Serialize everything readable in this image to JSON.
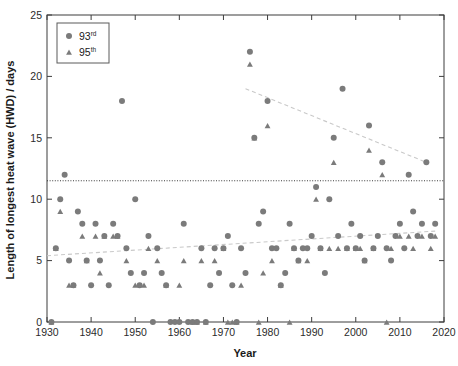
{
  "chart_data": {
    "type": "scatter",
    "title": "",
    "xlabel": "Year",
    "ylabel": "Length of longest heat wave (HWD) / days",
    "xlim": [
      1930,
      2020
    ],
    "ylim": [
      0,
      25
    ],
    "xticks": [
      1930,
      1940,
      1950,
      1960,
      1970,
      1980,
      1990,
      2000,
      2010,
      2020
    ],
    "yticks": [
      0,
      5,
      10,
      15,
      20,
      25
    ],
    "grid": false,
    "legend_position": "top-left",
    "legend": [
      {
        "label": "93",
        "suffix": "rd",
        "marker": "circle",
        "color": "#7b7b7b"
      },
      {
        "label": "95",
        "suffix": "th",
        "marker": "triangle",
        "color": "#7b7b7b"
      }
    ],
    "annotations": [
      {
        "name": "reference-line",
        "type": "horizontal-dotted",
        "y": 11.5,
        "color": "#3a3a3a"
      },
      {
        "name": "upper-trend-line",
        "type": "dashed-trend",
        "x0": 1975,
        "y0": 19.0,
        "x1": 2016,
        "y1": 13.0,
        "color": "#c9c9c9"
      },
      {
        "name": "lower-trend-line",
        "type": "dashed-trend",
        "x0": 1930,
        "y0": 5.4,
        "x1": 2018,
        "y1": 7.4,
        "color": "#c9c9c9"
      }
    ],
    "series": [
      {
        "name": "93rd",
        "marker": "circle",
        "color": "#7b7b7b",
        "points": [
          [
            1931,
            0
          ],
          [
            1932,
            6
          ],
          [
            1933,
            10
          ],
          [
            1934,
            12
          ],
          [
            1935,
            5
          ],
          [
            1936,
            3
          ],
          [
            1937,
            9
          ],
          [
            1938,
            8
          ],
          [
            1939,
            5
          ],
          [
            1940,
            3
          ],
          [
            1941,
            8
          ],
          [
            1942,
            5
          ],
          [
            1943,
            7
          ],
          [
            1944,
            3
          ],
          [
            1945,
            8
          ],
          [
            1946,
            7
          ],
          [
            1947,
            18
          ],
          [
            1948,
            6
          ],
          [
            1949,
            4
          ],
          [
            1950,
            10
          ],
          [
            1951,
            3
          ],
          [
            1952,
            4
          ],
          [
            1953,
            7
          ],
          [
            1954,
            0
          ],
          [
            1955,
            6
          ],
          [
            1956,
            4
          ],
          [
            1957,
            3
          ],
          [
            1958,
            0
          ],
          [
            1959,
            0
          ],
          [
            1960,
            0
          ],
          [
            1961,
            8
          ],
          [
            1962,
            0
          ],
          [
            1963,
            0
          ],
          [
            1964,
            0
          ],
          [
            1965,
            6
          ],
          [
            1966,
            0
          ],
          [
            1967,
            3
          ],
          [
            1968,
            6
          ],
          [
            1969,
            4
          ],
          [
            1970,
            6
          ],
          [
            1971,
            7
          ],
          [
            1972,
            3
          ],
          [
            1973,
            0
          ],
          [
            1974,
            6
          ],
          [
            1975,
            4
          ],
          [
            1976,
            22
          ],
          [
            1977,
            15
          ],
          [
            1978,
            8
          ],
          [
            1979,
            9
          ],
          [
            1980,
            18
          ],
          [
            1981,
            6
          ],
          [
            1982,
            6
          ],
          [
            1983,
            3
          ],
          [
            1984,
            4
          ],
          [
            1985,
            8
          ],
          [
            1986,
            6
          ],
          [
            1987,
            5
          ],
          [
            1988,
            6
          ],
          [
            1989,
            6
          ],
          [
            1990,
            7
          ],
          [
            1991,
            11
          ],
          [
            1992,
            6
          ],
          [
            1993,
            4
          ],
          [
            1994,
            10
          ],
          [
            1995,
            15
          ],
          [
            1996,
            7
          ],
          [
            1997,
            19
          ],
          [
            1998,
            6
          ],
          [
            1999,
            8
          ],
          [
            2000,
            6
          ],
          [
            2001,
            7
          ],
          [
            2002,
            5
          ],
          [
            2003,
            16
          ],
          [
            2004,
            6
          ],
          [
            2005,
            7
          ],
          [
            2006,
            13
          ],
          [
            2007,
            6
          ],
          [
            2008,
            5
          ],
          [
            2009,
            7
          ],
          [
            2010,
            8
          ],
          [
            2011,
            6
          ],
          [
            2012,
            12
          ],
          [
            2013,
            9
          ],
          [
            2014,
            7
          ],
          [
            2015,
            8
          ],
          [
            2016,
            13
          ],
          [
            2017,
            7
          ],
          [
            2018,
            8
          ]
        ]
      },
      {
        "name": "95th",
        "marker": "triangle",
        "color": "#7b7b7b",
        "points": [
          [
            1931,
            0
          ],
          [
            1932,
            6
          ],
          [
            1933,
            9
          ],
          [
            1935,
            3
          ],
          [
            1936,
            3
          ],
          [
            1938,
            7
          ],
          [
            1939,
            5
          ],
          [
            1941,
            7
          ],
          [
            1942,
            4
          ],
          [
            1943,
            7
          ],
          [
            1945,
            7
          ],
          [
            1946,
            7
          ],
          [
            1948,
            5
          ],
          [
            1950,
            3
          ],
          [
            1952,
            3
          ],
          [
            1953,
            6
          ],
          [
            1955,
            5
          ],
          [
            1957,
            3
          ],
          [
            1960,
            3
          ],
          [
            1961,
            5
          ],
          [
            1963,
            0
          ],
          [
            1964,
            0
          ],
          [
            1965,
            5
          ],
          [
            1966,
            0
          ],
          [
            1968,
            5
          ],
          [
            1970,
            6
          ],
          [
            1971,
            0
          ],
          [
            1972,
            0
          ],
          [
            1973,
            0
          ],
          [
            1974,
            3
          ],
          [
            1976,
            21
          ],
          [
            1977,
            15
          ],
          [
            1978,
            0
          ],
          [
            1979,
            4
          ],
          [
            1980,
            16
          ],
          [
            1981,
            5
          ],
          [
            1983,
            3
          ],
          [
            1985,
            0
          ],
          [
            1986,
            6
          ],
          [
            1987,
            5
          ],
          [
            1989,
            5
          ],
          [
            1991,
            10
          ],
          [
            1992,
            6
          ],
          [
            1994,
            6
          ],
          [
            1995,
            13
          ],
          [
            1996,
            6
          ],
          [
            1998,
            6
          ],
          [
            2000,
            6
          ],
          [
            2001,
            6
          ],
          [
            2002,
            5
          ],
          [
            2003,
            14
          ],
          [
            2004,
            6
          ],
          [
            2006,
            12
          ],
          [
            2007,
            0
          ],
          [
            2008,
            6
          ],
          [
            2010,
            7
          ],
          [
            2012,
            7
          ],
          [
            2013,
            6
          ],
          [
            2015,
            7
          ],
          [
            2017,
            6
          ],
          [
            2018,
            7
          ]
        ]
      }
    ]
  }
}
